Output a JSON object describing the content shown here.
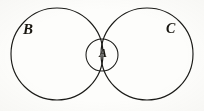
{
  "figure": {
    "kind": "venn-diagram",
    "caption": "",
    "background_color": "#fdfdfb",
    "ink_color": "#1b1b18",
    "labels": {
      "left_circle": "B",
      "right_circle": "C",
      "intersection_circle": "A"
    },
    "shapes": [
      {
        "name": "left-large-circle",
        "label": "B",
        "cx": 57,
        "cy": 54,
        "r": 46
      },
      {
        "name": "right-large-circle",
        "label": "C",
        "cx": 147,
        "cy": 54,
        "r": 46
      },
      {
        "name": "intersection-small-circle",
        "label": "A",
        "cx": 102,
        "cy": 55,
        "r": 16
      }
    ]
  },
  "chart_data": {
    "type": "diagram",
    "title": "",
    "subtitle": "",
    "xlabel": "",
    "ylabel": "",
    "legend": [],
    "sets": [
      {
        "name": "B",
        "cx": 57,
        "cy": 54,
        "r": 46
      },
      {
        "name": "C",
        "cx": 147,
        "cy": 54,
        "r": 46
      },
      {
        "name": "A",
        "cx": 102,
        "cy": 55,
        "r": 16
      }
    ],
    "relations": [
      "A lies inside the overlap of B and C",
      "B and C overlap in a lens-shaped region"
    ]
  }
}
